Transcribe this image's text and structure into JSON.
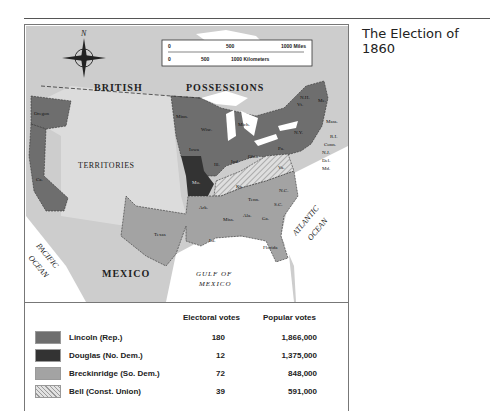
{
  "caption": {
    "title": "The Election of 1860"
  },
  "map": {
    "labels": {
      "compass_north": "N",
      "british_possessions_1": "BRITISH",
      "british_possessions_2": "POSSESSIONS",
      "territories": "TERRITORIES",
      "mexico": "MEXICO",
      "gulf_1": "GULF OF",
      "gulf_2": "MEXICO",
      "atlantic_1": "ATLANTIC",
      "atlantic_2": "OCEAN",
      "pacific_1": "PACIFIC",
      "pacific_2": "OCEAN"
    },
    "scale": {
      "miles": [
        "0",
        "500",
        "1000 Miles"
      ],
      "kilometers": [
        "0",
        "500",
        "1000 Kilometers"
      ]
    },
    "states": [
      {
        "abbr": "Oregon",
        "winner": "Lincoln"
      },
      {
        "abbr": "Ca.",
        "winner": "Lincoln"
      },
      {
        "abbr": "Minn.",
        "winner": "Lincoln"
      },
      {
        "abbr": "Wisc.",
        "winner": "Lincoln"
      },
      {
        "abbr": "Iowa",
        "winner": "Lincoln"
      },
      {
        "abbr": "Mich.",
        "winner": "Lincoln"
      },
      {
        "abbr": "Ill.",
        "winner": "Lincoln"
      },
      {
        "abbr": "Ind.",
        "winner": "Lincoln"
      },
      {
        "abbr": "Ohio",
        "winner": "Lincoln"
      },
      {
        "abbr": "Pa.",
        "winner": "Lincoln"
      },
      {
        "abbr": "N.Y.",
        "winner": "Lincoln"
      },
      {
        "abbr": "Vt.",
        "winner": "Lincoln"
      },
      {
        "abbr": "N.H.",
        "winner": "Lincoln"
      },
      {
        "abbr": "Me.",
        "winner": "Lincoln"
      },
      {
        "abbr": "Mass.",
        "winner": "Lincoln"
      },
      {
        "abbr": "R.I.",
        "winner": "Lincoln"
      },
      {
        "abbr": "Conn.",
        "winner": "Lincoln"
      },
      {
        "abbr": "N.J.",
        "winner": "Lincoln"
      },
      {
        "abbr": "Mo.",
        "winner": "Douglas"
      },
      {
        "abbr": "Del.",
        "winner": "Breckinridge"
      },
      {
        "abbr": "Md.",
        "winner": "Breckinridge"
      },
      {
        "abbr": "Va.",
        "winner": "Bell"
      },
      {
        "abbr": "Ky.",
        "winner": "Bell"
      },
      {
        "abbr": "Tenn.",
        "winner": "Bell"
      },
      {
        "abbr": "N.C.",
        "winner": "Breckinridge"
      },
      {
        "abbr": "S.C.",
        "winner": "Breckinridge"
      },
      {
        "abbr": "Ga.",
        "winner": "Breckinridge"
      },
      {
        "abbr": "Ala.",
        "winner": "Breckinridge"
      },
      {
        "abbr": "Miss.",
        "winner": "Breckinridge"
      },
      {
        "abbr": "Ark.",
        "winner": "Breckinridge"
      },
      {
        "abbr": "La.",
        "winner": "Breckinridge"
      },
      {
        "abbr": "Texas",
        "winner": "Breckinridge"
      },
      {
        "abbr": "Florida",
        "winner": "Breckinridge"
      }
    ]
  },
  "legend": {
    "header_electoral": "Electoral votes",
    "header_popular": "Popular votes",
    "rows": [
      {
        "candidate": "Lincoln (Rep.)",
        "electoral": "180",
        "popular": "1,866,000",
        "color": "#6e6e6e"
      },
      {
        "candidate": "Douglas (No. Dem.)",
        "electoral": "12",
        "popular": "1,375,000",
        "color": "#333333"
      },
      {
        "candidate": "Breckinridge (So. Dem.)",
        "electoral": "72",
        "popular": "848,000",
        "color": "#a3a3a3"
      },
      {
        "candidate": "Bell (Const. Union)",
        "electoral": "39",
        "popular": "591,000",
        "color": "hatched"
      }
    ]
  }
}
